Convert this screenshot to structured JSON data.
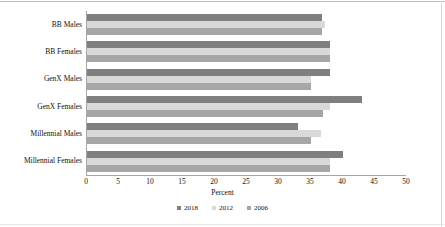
{
  "chart_data": {
    "type": "bar",
    "orientation": "horizontal",
    "title": "",
    "xlabel": "Percent",
    "ylabel": "",
    "xlim": [
      0,
      50
    ],
    "xticks": [
      0,
      5,
      10,
      15,
      20,
      25,
      30,
      35,
      40,
      45,
      50
    ],
    "grid": false,
    "legend_position": "bottom",
    "categories": [
      "BB Males",
      "BB Females",
      "GenX Males",
      "GenX Females",
      "Millennial Males",
      "Millennial Females"
    ],
    "series": [
      {
        "name": "2018",
        "color": "#7f7f7f",
        "values": [
          36.7,
          38.0,
          38.0,
          43.0,
          33.0,
          40.0
        ]
      },
      {
        "name": "2012",
        "color": "#d9d9d9",
        "values": [
          37.2,
          38.0,
          35.0,
          38.0,
          36.6,
          38.0
        ]
      },
      {
        "name": "2006",
        "color": "#a6a6a6",
        "values": [
          36.7,
          38.0,
          35.0,
          36.8,
          35.0,
          38.0
        ]
      }
    ]
  },
  "colors": {
    "series_2018": "#7f7f7f",
    "series_2012": "#d9d9d9",
    "series_2006": "#a6a6a6",
    "axis": "#a6a6a6",
    "text": "#111111",
    "background": "#ffffff"
  }
}
